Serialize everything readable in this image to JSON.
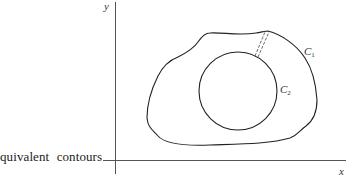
{
  "caption": {
    "word1": "quivalent",
    "word2": "contours"
  },
  "axes": {
    "x_label": "x",
    "y_label": "y"
  },
  "contours": [
    {
      "id": "outer",
      "label": "C",
      "subscript": "1"
    },
    {
      "id": "inner",
      "label": "C",
      "subscript": "2"
    }
  ],
  "colors": {
    "stroke": "#222222",
    "axis": "#555555",
    "background": "#ffffff"
  }
}
